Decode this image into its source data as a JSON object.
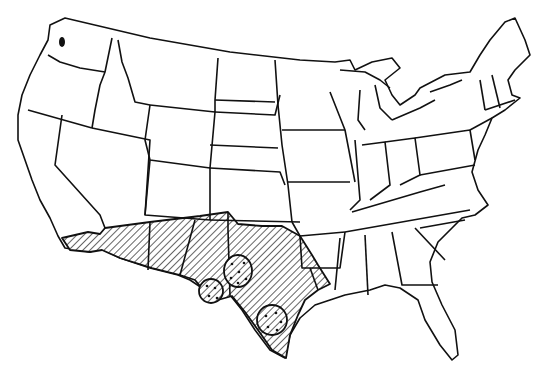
{
  "map": {
    "title": "",
    "region": "Contiguous United States",
    "style": "black-and-white state outline map",
    "colors": {
      "outline": "#111111",
      "background": "#ffffff",
      "hatch": "#111111"
    },
    "shaded_range": {
      "pattern": "diagonal-hatch",
      "states_covered": [
        "Southern California (partial)",
        "Arizona (southern)",
        "New Mexico (southern)",
        "Texas",
        "Oklahoma (southern edge)",
        "Louisiana (western)"
      ]
    },
    "circled_clusters": [
      {
        "id": "cluster-west-texas",
        "dots": 4
      },
      {
        "id": "cluster-central-texas",
        "dots": 6
      },
      {
        "id": "cluster-gulf-coast-texas",
        "dots": 5
      }
    ]
  }
}
